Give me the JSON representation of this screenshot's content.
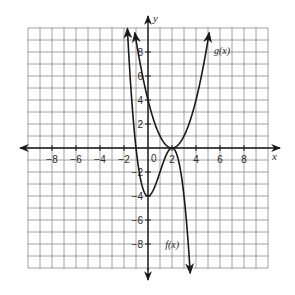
{
  "chart_data": {
    "type": "line",
    "title": "",
    "xlabel": "x",
    "ylabel": "y",
    "xlim": [
      -10,
      10
    ],
    "ylim": [
      -10,
      10
    ],
    "grid": true,
    "grid_step": 1,
    "x_ticks": [
      -8,
      -6,
      -4,
      -2,
      2,
      4,
      6,
      8
    ],
    "y_ticks": [
      -8,
      -6,
      -4,
      -2,
      2,
      4,
      6,
      8
    ],
    "x_tick_labels": [
      "−8",
      "−6",
      "−4",
      "−2",
      "2",
      "4",
      "6",
      "8"
    ],
    "y_tick_labels": [
      "−8",
      "−6",
      "−4",
      "−2",
      "2",
      "4",
      "6",
      "8"
    ],
    "origin_label": "0",
    "legend": "none",
    "series": [
      {
        "name": "f(x)",
        "label": "f(x)",
        "label_position": {
          "x": 1.6,
          "y": -8
        },
        "formula": "-(x-2)^2 (x+1)",
        "domain": [
          -1.72,
          3.52
        ],
        "key_points": [
          {
            "x": -1.7,
            "y": 9.6
          },
          {
            "x": -1,
            "y": 0
          },
          {
            "x": 0,
            "y": -4
          },
          {
            "x": 2,
            "y": 0
          },
          {
            "x": 3,
            "y": -4
          },
          {
            "x": 3.5,
            "y": -10.1
          }
        ],
        "arrows": "both-ends"
      },
      {
        "name": "g(x)",
        "label": "g(x)",
        "label_position": {
          "x": 5.5,
          "y": 8
        },
        "formula": "(x-2)^2",
        "domain": [
          -1.1,
          5.1
        ],
        "key_points": [
          {
            "x": -1.1,
            "y": 9.6
          },
          {
            "x": 0,
            "y": 4
          },
          {
            "x": 2,
            "y": 0
          },
          {
            "x": 4,
            "y": 4
          },
          {
            "x": 5.1,
            "y": 9.6
          }
        ],
        "arrows": "both-ends"
      }
    ]
  },
  "labels": {
    "x_axis": "x",
    "y_axis": "y",
    "origin": "0",
    "f": "f(x)",
    "g": "g(x)"
  }
}
